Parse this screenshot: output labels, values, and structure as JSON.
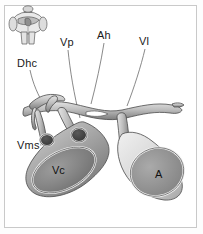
{
  "figure": {
    "background_color": "#ffffff",
    "frame_color": "#c9c9c9",
    "style": "grayscale line drawing with shaded tubular vessels"
  },
  "inset": {
    "name": "body-orientation-inset",
    "description": "small grayscale torso illustration indicating body region"
  },
  "labels": [
    {
      "id": "dhc",
      "text": "Dhc",
      "x": 17,
      "y": 58,
      "leader": "curve down-right to small cut duct"
    },
    {
      "id": "vp",
      "text": "Vp",
      "x": 60,
      "y": 37,
      "leader": "curve down to central vessel"
    },
    {
      "id": "ah",
      "text": "Ah",
      "x": 97,
      "y": 30,
      "leader": "curve down to arterial arch"
    },
    {
      "id": "vl",
      "text": "Vl",
      "x": 139,
      "y": 36,
      "leader": "curve down-left to right branch"
    },
    {
      "id": "vms",
      "text": "Vms",
      "x": 17,
      "y": 140,
      "leader": "horizontal line right to vessel stump"
    }
  ],
  "vessel_labels": [
    {
      "id": "vc",
      "text": "Vc",
      "x": 52,
      "y": 164,
      "shape": "large elliptical vein cross-section, left"
    },
    {
      "id": "a",
      "text": "A",
      "x": 155,
      "y": 168,
      "shape": "large circular artery cross-section, right"
    }
  ],
  "colors": {
    "outline": "#4a4a4a",
    "vessel_light": "#d8d8d8",
    "vessel_mid": "#a8a8a8",
    "vessel_dark": "#6e6e6e",
    "lumen_vc": "#8a8a8a",
    "lumen_a": "#9a9a9a",
    "lumen_small": "#3c3c3c",
    "leader_line": "#6b6b6b",
    "text": "#1a1a1a"
  }
}
